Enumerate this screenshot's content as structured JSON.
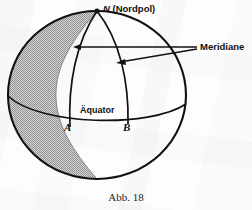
{
  "figure": {
    "caption": "Abb. 18",
    "background_color": "#fdfdfd",
    "ink_color": "#111111",
    "shade_color": "#b0b0b0"
  },
  "labels": {
    "north_pole_symbol": "N",
    "north_pole_name": "(Nordpol)",
    "meridians": "Meridiane",
    "equator": "Äquator",
    "point_a": "A",
    "point_b": "B"
  },
  "diagram": {
    "sphere": {
      "center_x": 97,
      "center_y": 95,
      "radius_x": 90,
      "radius_y": 85
    },
    "north_pole_point": {
      "x": 97,
      "y": 11
    },
    "equator_endpoints": {
      "left_x": 8,
      "right_y": 105
    },
    "meridian_a_foot": {
      "x": 70,
      "y": 127
    },
    "meridian_b_foot": {
      "x": 128,
      "y": 124
    },
    "arrow_origin": {
      "x": 197,
      "y": 48
    },
    "arrow_tips": [
      {
        "x": 74,
        "y": 47
      },
      {
        "x": 117,
        "y": 62
      }
    ]
  }
}
